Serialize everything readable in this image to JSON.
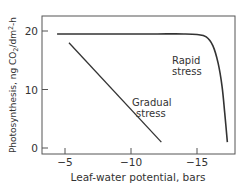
{
  "chart_data": {
    "type": "line",
    "title": "",
    "xlabel": "Leaf-water potential, bars",
    "ylabel": "Photosynthesis, ng CO2/dm2-h",
    "xlim": [
      -3.2,
      -18.0
    ],
    "ylim": [
      -1,
      23.5
    ],
    "xticks": [
      -5,
      -10,
      -15
    ],
    "xtick_labels": [
      "−5",
      "−10",
      "−15"
    ],
    "yticks": [
      0,
      10,
      20
    ],
    "ytick_labels": [
      "0",
      "10",
      "20"
    ],
    "grid": false,
    "legend": "none (inline labels)",
    "series": [
      {
        "name": "Rapid stress",
        "label_lines": [
          "Rapid",
          "stress"
        ],
        "x": [
          -4.4,
          -8,
          -10,
          -12,
          -14,
          -15,
          -15.7,
          -16.2,
          -16.6,
          -16.9,
          -17.1,
          -17.3
        ],
        "y": [
          19.5,
          19.5,
          19.5,
          19.5,
          19.5,
          19.4,
          19.0,
          17.5,
          14.5,
          10.5,
          6,
          1
        ]
      },
      {
        "name": "Gradual stress",
        "label_lines": [
          "Gradual",
          "stress"
        ],
        "x": [
          -5.3,
          -12.3
        ],
        "y": [
          18.0,
          1.0
        ]
      }
    ]
  }
}
